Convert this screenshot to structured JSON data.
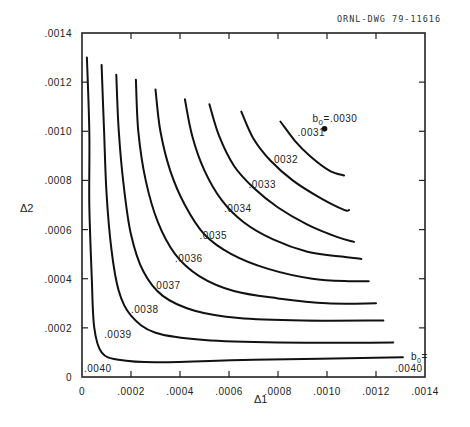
{
  "chart_data": {
    "type": "line",
    "subtype": "contour",
    "title": "",
    "drawing_id": "ORNL-DWG 79-11616",
    "xlabel": "Δ1",
    "ylabel": "Δ2",
    "xlim": [
      0,
      0.0014
    ],
    "ylim": [
      0,
      0.0014
    ],
    "grid": false,
    "x_ticks": [
      "0",
      ".0002",
      ".0004",
      ".0006",
      ".0008",
      ".0010",
      ".0012",
      ".0014"
    ],
    "y_ticks": [
      "0",
      ".0002",
      ".0004",
      ".0006",
      ".0008",
      ".0010",
      ".0012",
      ".0014"
    ],
    "point": {
      "label": "b0 = .0030",
      "label_prefix": "b",
      "label_sub": "0",
      "label_value": "=.0030",
      "x": 0.00099,
      "y": 0.00101
    },
    "corner_labels": [
      {
        "text": ".0040",
        "position": "bottom-left"
      },
      {
        "text": "b0=",
        "prefix": "b",
        "sub": "0",
        "suffix": "=",
        "position": "bottom-right"
      },
      {
        "text": ".0040",
        "position": "bottom-right"
      }
    ],
    "series": [
      {
        "name": ".0031",
        "label": ".0031",
        "points": [
          [
            0.00081,
            0.00104
          ],
          [
            0.00087,
            0.00096
          ],
          [
            0.00093,
            0.0009
          ],
          [
            0.00101,
            0.00084
          ],
          [
            0.00107,
            0.00082
          ]
        ]
      },
      {
        "name": ".0032",
        "label": ".0032",
        "points": [
          [
            0.00065,
            0.00108
          ],
          [
            0.0007,
            0.00097
          ],
          [
            0.00077,
            0.00088
          ],
          [
            0.00086,
            0.0008
          ],
          [
            0.00097,
            0.00073
          ],
          [
            0.00107,
            0.00068
          ],
          [
            0.00109,
            0.00068
          ]
        ]
      },
      {
        "name": ".0033",
        "label": ".0033",
        "points": [
          [
            0.00052,
            0.00111
          ],
          [
            0.00056,
            0.00098
          ],
          [
            0.00062,
            0.00086
          ],
          [
            0.0007,
            0.00077
          ],
          [
            0.0008,
            0.00069
          ],
          [
            0.00092,
            0.00062
          ],
          [
            0.00104,
            0.00057
          ],
          [
            0.00111,
            0.00055
          ]
        ]
      },
      {
        "name": ".0034",
        "label": ".0034",
        "points": [
          [
            0.00042,
            0.00113
          ],
          [
            0.00045,
            0.00098
          ],
          [
            0.0005,
            0.00084
          ],
          [
            0.00057,
            0.00072
          ],
          [
            0.00066,
            0.00063
          ],
          [
            0.00078,
            0.00056
          ],
          [
            0.00092,
            0.00051
          ],
          [
            0.00106,
            0.00049
          ],
          [
            0.00114,
            0.00048
          ]
        ]
      },
      {
        "name": ".0035",
        "label": ".0035",
        "points": [
          [
            0.0003,
            0.00117
          ],
          [
            0.00032,
            0.001
          ],
          [
            0.00036,
            0.00084
          ],
          [
            0.00042,
            0.0007
          ],
          [
            0.0005,
            0.00058
          ],
          [
            0.00061,
            0.0005
          ],
          [
            0.00076,
            0.00044
          ],
          [
            0.00094,
            0.0004
          ],
          [
            0.0011,
            0.00039
          ],
          [
            0.00117,
            0.00039
          ]
        ]
      },
      {
        "name": ".0036",
        "label": ".0036",
        "points": [
          [
            0.00022,
            0.00121
          ],
          [
            0.00023,
            0.001
          ],
          [
            0.00026,
            0.0008
          ],
          [
            0.00031,
            0.00063
          ],
          [
            0.00038,
            0.0005
          ],
          [
            0.00048,
            0.00041
          ],
          [
            0.00062,
            0.00035
          ],
          [
            0.0008,
            0.00032
          ],
          [
            0.001,
            0.0003
          ],
          [
            0.0012,
            0.0003
          ]
        ]
      },
      {
        "name": ".0037",
        "label": ".0037",
        "points": [
          [
            0.00014,
            0.00123
          ],
          [
            0.00015,
            0.001
          ],
          [
            0.00017,
            0.00078
          ],
          [
            0.0002,
            0.00058
          ],
          [
            0.00025,
            0.00043
          ],
          [
            0.00033,
            0.00033
          ],
          [
            0.00046,
            0.00027
          ],
          [
            0.00064,
            0.00024
          ],
          [
            0.0009,
            0.00023
          ],
          [
            0.00123,
            0.00023
          ]
        ]
      },
      {
        "name": ".0038",
        "label": ".0038",
        "points": [
          [
            8e-05,
            0.00127
          ],
          [
            9e-05,
            0.001
          ],
          [
            0.0001,
            0.00075
          ],
          [
            0.00012,
            0.00052
          ],
          [
            0.00015,
            0.00035
          ],
          [
            0.0002,
            0.00025
          ],
          [
            0.0003,
            0.00018
          ],
          [
            0.0005,
            0.00015
          ],
          [
            0.0008,
            0.00014
          ],
          [
            0.00127,
            0.00014
          ]
        ]
      },
      {
        "name": ".0039",
        "label": ".0039",
        "points": [
          [
            2e-05,
            0.0013
          ],
          [
            3e-05,
            0.001
          ],
          [
            3e-05,
            0.0007
          ],
          [
            4e-05,
            0.0004
          ],
          [
            5e-05,
            0.0002
          ],
          [
            8e-05,
            0.0001
          ],
          [
            0.00015,
            7e-05
          ],
          [
            0.0003,
            6e-05
          ],
          [
            0.0007,
            7e-05
          ],
          [
            0.00131,
            8e-05
          ]
        ]
      }
    ],
    "contour_label_positions": [
      {
        "text": ".0031",
        "x": 0.00088,
        "y": 0.00098
      },
      {
        "text": ".0032",
        "x": 0.00077,
        "y": 0.00087
      },
      {
        "text": ".0033",
        "x": 0.00068,
        "y": 0.00077
      },
      {
        "text": ".0034",
        "x": 0.00058,
        "y": 0.00067
      },
      {
        "text": ".0035",
        "x": 0.00048,
        "y": 0.00056
      },
      {
        "text": ".0036",
        "x": 0.00038,
        "y": 0.00047
      },
      {
        "text": ".0037",
        "x": 0.00029,
        "y": 0.00036
      },
      {
        "text": ".0038",
        "x": 0.0002,
        "y": 0.00026
      },
      {
        "text": ".0039",
        "x": 9e-05,
        "y": 0.00016
      }
    ]
  }
}
